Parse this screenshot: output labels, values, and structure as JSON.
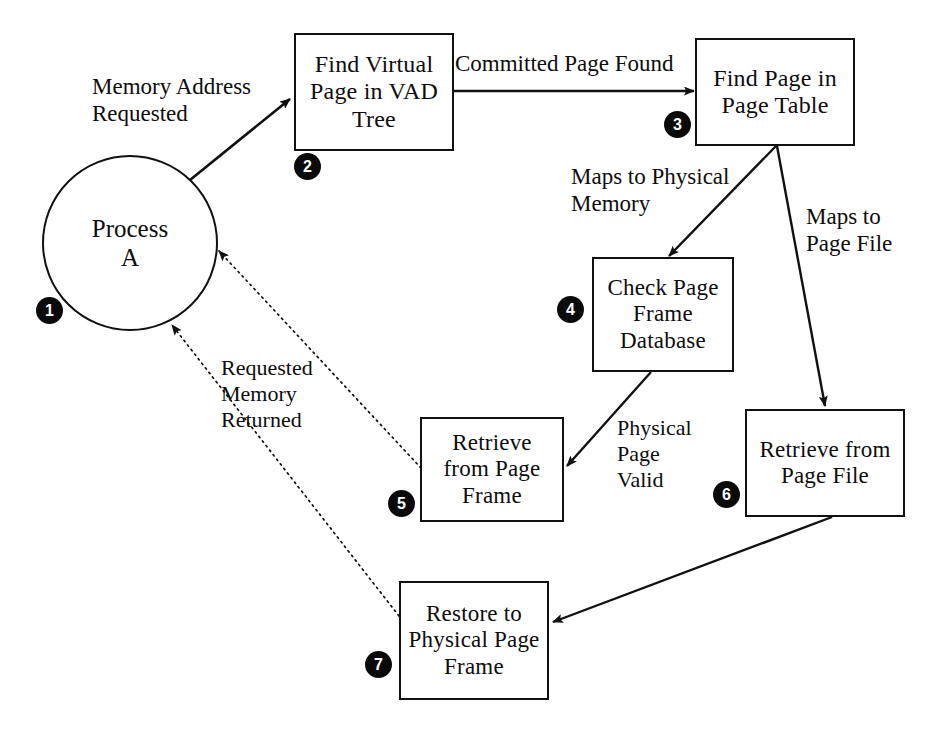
{
  "diagram": {
    "type": "flowchart",
    "colors": {
      "stroke": "#111111",
      "background": "#ffffff",
      "badge_fill": "#0a0a0a",
      "badge_text": "#ffffff"
    }
  },
  "nodes": [
    {
      "id": "n1",
      "badge": "1",
      "shape": "circle",
      "label": "Process\nA"
    },
    {
      "id": "n2",
      "badge": "2",
      "shape": "rect",
      "label": "Find Virtual\nPage in VAD\nTree"
    },
    {
      "id": "n3",
      "badge": "3",
      "shape": "rect",
      "label": "Find Page in\nPage Table"
    },
    {
      "id": "n4",
      "badge": "4",
      "shape": "rect",
      "label": "Check Page\nFrame\nDatabase"
    },
    {
      "id": "n5",
      "badge": "5",
      "shape": "rect",
      "label": "Retrieve\nfrom Page\nFrame"
    },
    {
      "id": "n6",
      "badge": "6",
      "shape": "rect",
      "label": "Retrieve from\nPage File"
    },
    {
      "id": "n7",
      "badge": "7",
      "shape": "rect",
      "label": "Restore to\nPhysical Page\nFrame"
    }
  ],
  "edges": [
    {
      "id": "e1",
      "from": "n1",
      "to": "n2",
      "label": "Memory Address\nRequested",
      "style": "solid"
    },
    {
      "id": "e2",
      "from": "n2",
      "to": "n3",
      "label": "Committed Page Found",
      "style": "solid"
    },
    {
      "id": "e3",
      "from": "n3",
      "to": "n4",
      "label": "Maps to Physical\nMemory",
      "style": "solid"
    },
    {
      "id": "e4",
      "from": "n3",
      "to": "n6",
      "label": "Maps to\nPage File",
      "style": "solid"
    },
    {
      "id": "e5",
      "from": "n4",
      "to": "n5",
      "label": "Physical\nPage\nValid",
      "style": "solid"
    },
    {
      "id": "e6",
      "from": "n6",
      "to": "n7",
      "label": "",
      "style": "solid"
    },
    {
      "id": "e7",
      "from": "n5",
      "to": "n1",
      "label": "Requested\nMemory\nReturned",
      "style": "dotted"
    },
    {
      "id": "e8",
      "from": "n7",
      "to": "n1",
      "label": "",
      "style": "dotted"
    }
  ]
}
